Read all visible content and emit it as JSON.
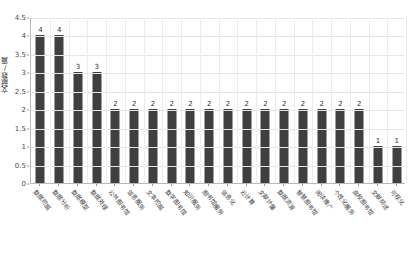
{
  "chart_data": {
    "type": "bar",
    "title": "",
    "xlabel": "",
    "ylabel": "文献数/篇",
    "ylim": [
      0,
      4.5
    ],
    "y_ticks": [
      "0",
      "0.5",
      "1",
      "1.5",
      "2",
      "2.5",
      "3",
      "3.5",
      "4",
      "4.5"
    ],
    "grid": true,
    "legend": "none",
    "bar_color": "#3f3f3f",
    "categories": [
      "数据挖掘",
      "数据分析",
      "数据模型",
      "数据处理",
      "公共图书馆",
      "信息服务",
      "文本挖掘",
      "数字图书馆",
      "知识服务",
      "图书馆服务",
      "信息化",
      "云计算",
      "文献计量",
      "数据资源",
      "智慧图书馆",
      "阅读推广",
      "个性化服务",
      "高校图书馆",
      "文献综述",
      "可视化"
    ],
    "values": [
      4,
      4,
      3,
      3,
      2,
      2,
      2,
      2,
      2,
      2,
      2,
      2,
      2,
      2,
      2,
      2,
      2,
      2,
      1,
      1
    ]
  }
}
